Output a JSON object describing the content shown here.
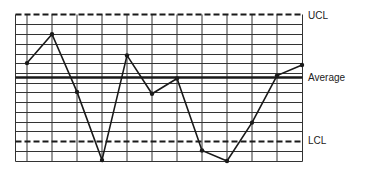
{
  "chart_data": {
    "type": "line",
    "title": "",
    "subtitle": "",
    "xlabel": "",
    "ylabel": "",
    "grid": true,
    "legend": "none",
    "x": [
      1,
      2,
      3,
      4,
      5,
      6,
      7,
      8,
      9,
      10,
      11,
      12
    ],
    "series": [
      {
        "name": "Process measurement",
        "values": [
          1.5,
          4.5,
          -1.5,
          -8.6,
          2.3,
          -1.7,
          -0.1,
          -7.6,
          -8.7,
          -4.7,
          0.2,
          1.3
        ]
      }
    ],
    "reference_lines": [
      {
        "name": "UCL",
        "label": "UCL",
        "value": 6.5,
        "style": "dashed"
      },
      {
        "name": "Average",
        "label": "Average",
        "value": 0.0,
        "style": "solid-thick"
      },
      {
        "name": "LCL",
        "label": "LCL",
        "value": -6.5,
        "style": "dashed"
      }
    ],
    "ylim": [
      -8.7,
      6.5
    ],
    "annotations": [
      "UCL",
      "Average",
      "LCL"
    ]
  },
  "labels": {
    "ucl": "UCL",
    "average": "Average",
    "lcl": "LCL"
  },
  "colors": {
    "line": "#1a1a1a",
    "grid": "#333333",
    "background": "#ffffff"
  }
}
